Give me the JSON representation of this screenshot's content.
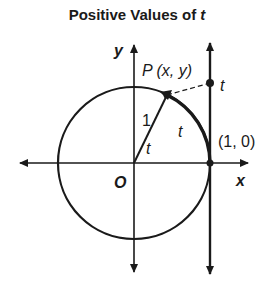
{
  "title": {
    "text": "Positive Values of ",
    "var": "t"
  },
  "labels": {
    "y_axis": "y",
    "x_axis": "x",
    "origin": "O",
    "point_p": "P (x, y)",
    "radius": "1",
    "angle": "t",
    "arc": "t",
    "tangent_value": "t",
    "point_10": "(1, 0)"
  },
  "colors": {
    "stroke": "#1a1a1a",
    "background": "#ffffff"
  }
}
